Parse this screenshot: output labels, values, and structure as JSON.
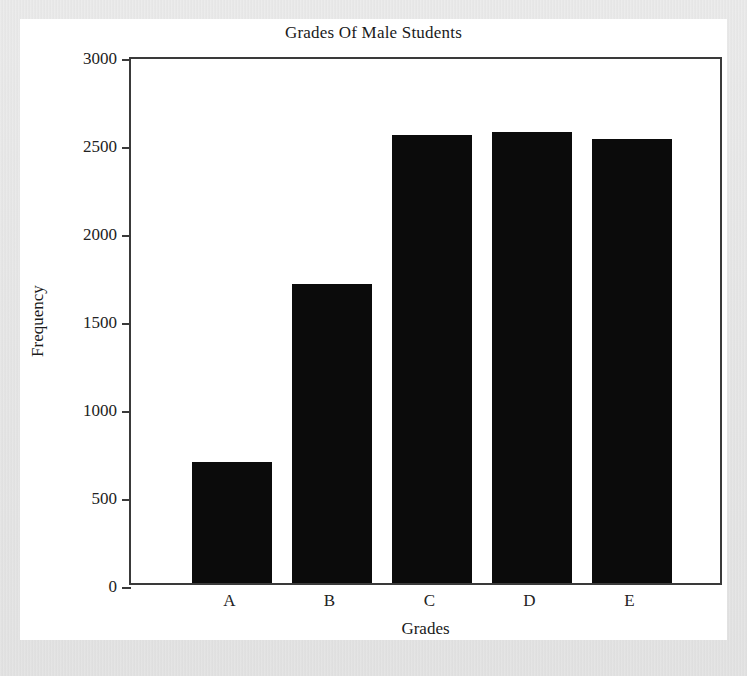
{
  "chart_data": {
    "type": "bar",
    "title": "Grades Of Male Students",
    "xlabel": "Grades",
    "ylabel": "Frequency",
    "categories": [
      "A",
      "B",
      "C",
      "D",
      "E"
    ],
    "values": [
      690,
      1700,
      2545,
      2560,
      2525
    ],
    "ylim": [
      0,
      3000
    ],
    "yticks": [
      0,
      500,
      1000,
      1500,
      2000,
      2500,
      3000
    ],
    "ytick_labels": [
      "0",
      "500",
      "1000",
      "1500",
      "2000",
      "2500",
      "3000"
    ],
    "grid": false,
    "legend": "none",
    "bar_color": "#0b0b0b",
    "axis_color": "#3a3a3a",
    "background_color": "#ffffff",
    "page_color": "#dcdcdc"
  }
}
